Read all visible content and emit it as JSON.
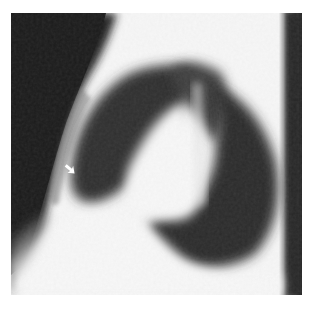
{
  "image": {
    "description": "Lateral chest radiograph with a small white arrow pointing to an anterior mediastinal / cardiac border finding",
    "modality": "X-ray",
    "view": "lateral",
    "annotations": [
      {
        "type": "arrow",
        "color": "#ffffff",
        "position": {
          "x": 66,
          "y": 160
        },
        "direction": "down-right"
      }
    ],
    "colors": {
      "background": "#ffffff",
      "dark_field": "#1e1e1e",
      "bright_tissue": "#f6f6f6",
      "lung_gray": "#3a3a3a"
    },
    "frame": {
      "x": 11,
      "y": 13,
      "width": 291,
      "height": 282
    }
  }
}
